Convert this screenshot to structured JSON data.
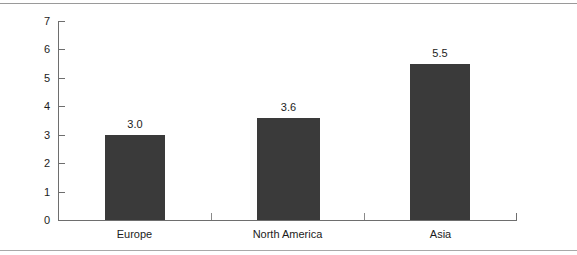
{
  "chart_data": {
    "type": "bar",
    "title": "",
    "subtitle": "",
    "xlabel": "",
    "ylabel": "",
    "categories": [
      "Europe",
      "North America",
      "Asia"
    ],
    "values": [
      3.0,
      3.6,
      5.5
    ],
    "value_labels": [
      "3.0",
      "3.6",
      "5.5"
    ],
    "ylim": [
      0,
      7
    ],
    "ytick_labels": [
      "0",
      "1",
      "2",
      "3",
      "4",
      "5",
      "6",
      "7"
    ],
    "ytick_values": [
      0,
      1,
      2,
      3,
      4,
      5,
      6,
      7
    ],
    "grid": false,
    "legend": false,
    "legend_position": "none",
    "bar_color": "#3a3a3a",
    "axis_color": "#6e6e6e",
    "background_color": "#ffffff"
  },
  "frame": {
    "top_rule_color": "#9a9a9a",
    "bottom_rule_color": "#a8a8a8"
  }
}
